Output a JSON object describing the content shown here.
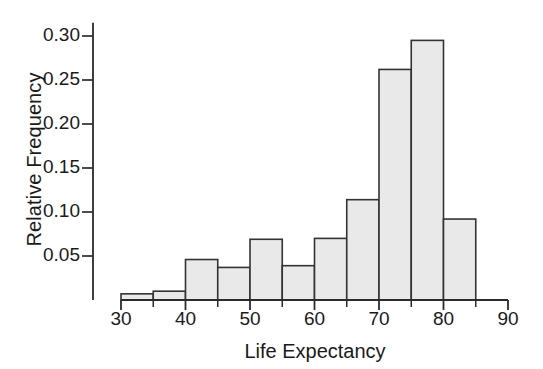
{
  "chart_data": {
    "type": "bar",
    "title": "",
    "subtitle": "",
    "xlabel": "Life Expectancy",
    "ylabel": "Relative Frequency",
    "bin_width": 5,
    "bin_edges": [
      30,
      35,
      40,
      45,
      50,
      55,
      60,
      65,
      70,
      75,
      80,
      85
    ],
    "categories": [
      "30-35",
      "35-40",
      "40-45",
      "45-50",
      "50-55",
      "55-60",
      "60-65",
      "65-70",
      "70-75",
      "75-80",
      "80-85"
    ],
    "values": [
      0.007,
      0.01,
      0.046,
      0.037,
      0.069,
      0.039,
      0.07,
      0.114,
      0.262,
      0.295,
      0.092
    ],
    "xlim": [
      30,
      90
    ],
    "ylim": [
      0,
      0.315
    ],
    "xticks": [
      30,
      40,
      50,
      60,
      70,
      80,
      90
    ],
    "xticks_minor": [
      35,
      45,
      55,
      65,
      75,
      85
    ],
    "xtick_labels": [
      "30",
      "40",
      "50",
      "60",
      "70",
      "80",
      "90"
    ],
    "yticks": [
      0.05,
      0.1,
      0.15,
      0.2,
      0.25,
      0.3
    ],
    "ytick_labels": [
      "0.05",
      "0.10",
      "0.15",
      "0.20",
      "0.25",
      "0.30"
    ],
    "grid": false,
    "legend": null,
    "bar_fill_color": "#e9e9e9",
    "bar_edge_color": "#333333",
    "axis_color": "#2b2b2b",
    "background_color": "#ffffff"
  }
}
